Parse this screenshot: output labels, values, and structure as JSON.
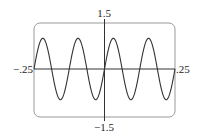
{
  "chart_data": {
    "type": "line",
    "title": "",
    "xlabel": "",
    "ylabel": "",
    "xlim": [
      -0.25,
      0.25
    ],
    "ylim": [
      -1.5,
      1.5
    ],
    "x_tick_labels": {
      "min": "−.25",
      "max": ".25"
    },
    "y_tick_labels": {
      "max": "1.5",
      "min": "−1.5"
    },
    "grid": false,
    "series": [
      {
        "name": "y = sin(16πx)",
        "function": "sin",
        "amplitude": 1,
        "period": 0.125,
        "cycles_shown": 4
      }
    ]
  }
}
